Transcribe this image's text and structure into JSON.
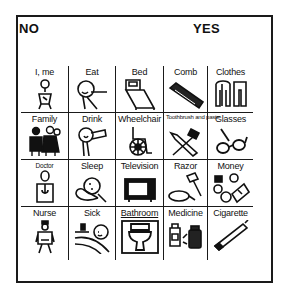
{
  "board": {
    "no_label": "NO",
    "yes_label": "YES",
    "rows": [
      [
        {
          "label": "I, me",
          "icon": "person-icon"
        },
        {
          "label": "Eat",
          "icon": "eat-icon"
        },
        {
          "label": "Bed",
          "icon": "bed-icon"
        },
        {
          "label": "Comb",
          "icon": "comb-icon"
        },
        {
          "label": "Clothes",
          "icon": "clothes-icon"
        }
      ],
      [
        {
          "label": "Family",
          "icon": "family-icon"
        },
        {
          "label": "Drink",
          "icon": "drink-icon"
        },
        {
          "label": "Wheelchair",
          "icon": "wheelchair-icon"
        },
        {
          "label": "Toothbrush and paste",
          "icon": "toothbrush-icon"
        },
        {
          "label": "Glasses",
          "icon": "glasses-icon"
        }
      ],
      [
        {
          "label": "Doctor",
          "icon": "doctor-icon"
        },
        {
          "label": "Sleep",
          "icon": "sleep-icon"
        },
        {
          "label": "Television",
          "icon": "television-icon"
        },
        {
          "label": "Razor",
          "icon": "razor-icon"
        },
        {
          "label": "Money",
          "icon": "money-icon"
        }
      ],
      [
        {
          "label": "Nurse",
          "icon": "nurse-icon"
        },
        {
          "label": "Sick",
          "icon": "sick-icon"
        },
        {
          "label": "Bathroom",
          "icon": "toilet-icon"
        },
        {
          "label": "Medicine",
          "icon": "medicine-icon"
        },
        {
          "label": "Cigarette",
          "icon": "cigarette-icon"
        }
      ]
    ]
  }
}
